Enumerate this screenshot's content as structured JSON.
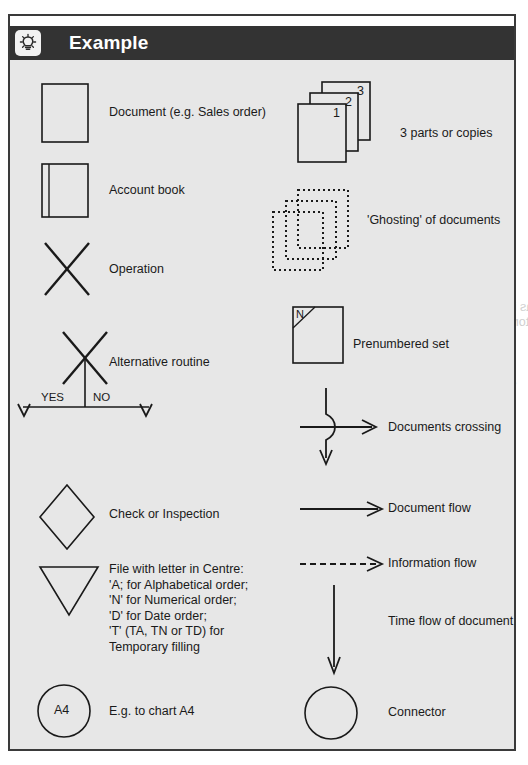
{
  "header": {
    "title": "Example",
    "icon": "lightbulb-icon"
  },
  "legend": {
    "left_column": [
      {
        "symbol": "document-rectangle",
        "label": "Document (e.g. Sales order)"
      },
      {
        "symbol": "account-book-rectangle",
        "label": "Account book"
      },
      {
        "symbol": "operation-cross",
        "label": "Operation"
      },
      {
        "symbol": "alternative-routine-cross",
        "label": "Alternative routine",
        "branch_yes": "YES",
        "branch_no": "NO"
      },
      {
        "symbol": "check-diamond",
        "label": "Check or Inspection"
      },
      {
        "symbol": "file-triangle",
        "label": "File with letter in Centre:\n'A; for Alphabetical order;\n'N' for Numerical order;\n'D' for Date order;\n'T' (TA, TN or TD) for\nTemporary filling"
      },
      {
        "symbol": "connector-circle-a4",
        "label": "E.g. to chart A4",
        "inner_text": "A4"
      }
    ],
    "right_column": [
      {
        "symbol": "stacked-documents",
        "label": "3 parts or copies",
        "copy_numbers": [
          "1",
          "2",
          "3"
        ]
      },
      {
        "symbol": "ghosting-dotted-documents",
        "label": "'Ghosting' of documents"
      },
      {
        "symbol": "prenumbered-set-box",
        "label": "Prenumbered set",
        "inner_text": "N"
      },
      {
        "symbol": "documents-crossing-arrows",
        "label": "Documents crossing"
      },
      {
        "symbol": "document-flow-arrow",
        "label": "Document flow"
      },
      {
        "symbol": "information-flow-dashed-arrow",
        "label": "Information flow"
      },
      {
        "symbol": "time-flow-line",
        "label": "Time flow of document"
      },
      {
        "symbol": "connector-circle",
        "label": "Connector"
      }
    ]
  },
  "colors": {
    "header_bar": "#333333",
    "panel_background": "#e7e7e7",
    "frame_border": "#3a3a3a",
    "ink": "#1a1a1a",
    "page_background": "#ffffff"
  },
  "bleed_text": {
    "lines": [
      "opies a colour",
      "The letter N in the circle indicates a pre-numbered set",
      "2.4    Flowlines",
      "a solid line represents documents and information flows down",
      "as indicated line. This flow would normally flow from the top to the",
      "bottom of the chart with such in right such the bottom the logic is not",
      "drawing problem",
      "2.5    Narrative",
      "all processes and checks performed by their names and these is",
      "written at the left of the symbol it refers to, or at the bottom",
      "in which case at the top left side of the beginning",
      "2.6    Columns",
      "The chart flow between the chart",
      "internal flows between various departments or",
      "between individuals within each department is filled",
      "labelled with the appropriate department",
      "2.7    Operation numbers",
      "given at the reference number each operation symbol",
      "of the chart. The operation numbers are normally",
      "sequential in the plus the title. Every symbol",
      "shown. Everything not carried out in a reference number",
      "the column line should be given a reference number"
    ]
  }
}
